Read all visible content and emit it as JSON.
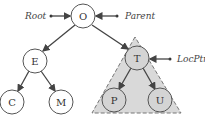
{
  "diagram": {
    "type": "binary-tree",
    "nodes": [
      {
        "id": "O",
        "label": "O",
        "x": 83,
        "y": 16
      },
      {
        "id": "E",
        "label": "E",
        "x": 35,
        "y": 61
      },
      {
        "id": "T",
        "label": "T",
        "x": 137,
        "y": 58
      },
      {
        "id": "C",
        "label": "C",
        "x": 12,
        "y": 102
      },
      {
        "id": "M",
        "label": "M",
        "x": 61,
        "y": 102
      },
      {
        "id": "P",
        "label": "P",
        "x": 114,
        "y": 100
      },
      {
        "id": "U",
        "label": "U",
        "x": 160,
        "y": 100
      }
    ],
    "edges": [
      {
        "from": "O",
        "to": "E"
      },
      {
        "from": "O",
        "to": "T"
      },
      {
        "from": "E",
        "to": "C"
      },
      {
        "from": "E",
        "to": "M"
      },
      {
        "from": "T",
        "to": "P"
      },
      {
        "from": "T",
        "to": "U"
      }
    ],
    "pointers": [
      {
        "label": "Root",
        "target": "O"
      },
      {
        "label": "Parent",
        "target": "O"
      },
      {
        "label": "LocPtr",
        "target": "T"
      }
    ],
    "subtree_highlight": {
      "root": "T",
      "fill": "#d9d9d9",
      "stroke": "#777777",
      "dashed": true
    },
    "colors": {
      "node_fill": "#ffffff",
      "shaded_node_fill": "#d4d4d4",
      "edge": "#444444"
    }
  }
}
